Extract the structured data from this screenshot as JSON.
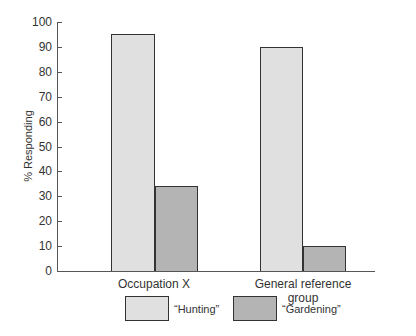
{
  "chart_data": {
    "type": "bar",
    "title": "",
    "xlabel": "",
    "ylabel": "% Responding",
    "ylim": [
      0,
      100
    ],
    "yticks": [
      0,
      10,
      20,
      30,
      40,
      50,
      60,
      70,
      80,
      90,
      100
    ],
    "grid": false,
    "legend_position": "bottom",
    "categories": [
      "Occupation X",
      "General reference group"
    ],
    "series": [
      {
        "name": "“Hunting”",
        "values": [
          95,
          90
        ],
        "color": "#e0e0e0"
      },
      {
        "name": "“Gardening”",
        "values": [
          34,
          10
        ],
        "color": "#b4b4b4"
      }
    ]
  },
  "labels": {
    "ylabel": "% Responding",
    "cat0": "Occupation X",
    "cat1": "General reference group",
    "legend0": "“Hunting”",
    "legend1": "“Gardening”",
    "ticks": [
      "0",
      "10",
      "20",
      "30",
      "40",
      "50",
      "60",
      "70",
      "80",
      "90",
      "100"
    ]
  }
}
